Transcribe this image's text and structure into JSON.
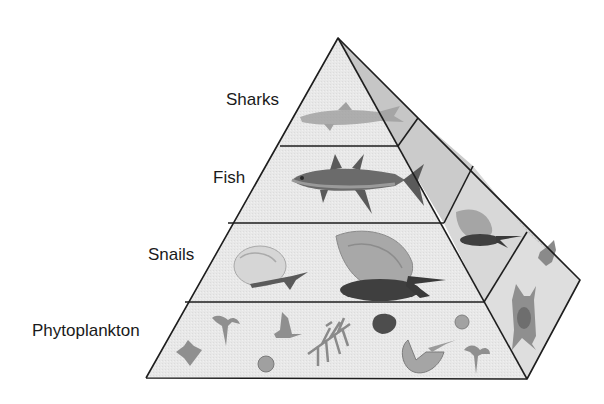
{
  "diagram": {
    "type": "ecological-pyramid",
    "levels": [
      {
        "label": "Sharks",
        "organisms": [
          "shark"
        ]
      },
      {
        "label": "Fish",
        "organisms": [
          "tuna"
        ]
      },
      {
        "label": "Snails",
        "organisms": [
          "small-snail",
          "large-snail"
        ]
      },
      {
        "label": "Phytoplankton",
        "organisms": [
          "dinoflagellate",
          "diatom",
          "radiolarian",
          "copepod-like",
          "foraminifera"
        ]
      }
    ],
    "colors": {
      "front_face": "#e6e6e6",
      "side_face": "#cfcfcf",
      "outline": "#1e1e1e",
      "organism_light": "#b5b5b5",
      "organism_mid": "#8a8a8a",
      "organism_dark": "#4d4d4d"
    }
  }
}
